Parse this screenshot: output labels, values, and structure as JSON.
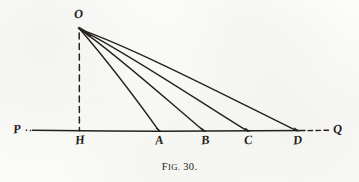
{
  "figure": {
    "caption_lead": "F",
    "caption_lead_small": "IG.",
    "caption_number": "30.",
    "caption_full": "FIG. 30.",
    "background_color": "#fbfbfa",
    "ink_color": "#24211f",
    "width": 359,
    "height": 182
  },
  "labels": {
    "apex": "O",
    "left_ray_end": "P",
    "right_ray_end": "Q",
    "foot": "H",
    "point_a": "A",
    "point_b": "B",
    "point_c": "C",
    "point_d": "D"
  },
  "geometry": {
    "apex_point": {
      "name": "O",
      "x": 79,
      "y": 28
    },
    "baseline": {
      "name": "PQ",
      "y": 131,
      "solid_start_x": 32,
      "solid_end_x": 305,
      "dashed_start_x": 308,
      "dashed_end_x": 329,
      "left_dots_x": [
        26,
        30
      ]
    },
    "perpendicular": {
      "name": "OH",
      "style": "dashed",
      "from": {
        "x": 79,
        "y": 32
      },
      "to": {
        "x": 79,
        "y": 131
      }
    },
    "base_points": [
      {
        "name": "H",
        "x": 79,
        "y": 131
      },
      {
        "name": "A",
        "x": 159,
        "y": 131
      },
      {
        "name": "B",
        "x": 204,
        "y": 131
      },
      {
        "name": "C",
        "x": 248,
        "y": 131
      },
      {
        "name": "D",
        "x": 297,
        "y": 131
      }
    ],
    "rays": [
      {
        "name": "OA",
        "to": "A"
      },
      {
        "name": "OB",
        "to": "B"
      },
      {
        "name": "OC",
        "to": "C"
      },
      {
        "name": "OD",
        "to": "D"
      }
    ]
  },
  "label_positions": {
    "O": {
      "x": 74,
      "y": 8
    },
    "P": {
      "x": 13,
      "y": 124
    },
    "Q": {
      "x": 333,
      "y": 124
    },
    "H": {
      "x": 75,
      "y": 134
    },
    "A": {
      "x": 155,
      "y": 134
    },
    "B": {
      "x": 201,
      "y": 134
    },
    "C": {
      "x": 244,
      "y": 134
    },
    "D": {
      "x": 293,
      "y": 134
    }
  }
}
